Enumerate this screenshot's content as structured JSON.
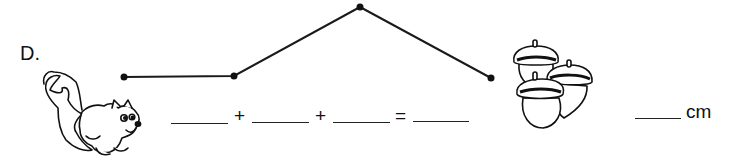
{
  "problem": {
    "label": "D.",
    "path": {
      "points": [
        [
          124,
          77
        ],
        [
          234,
          76
        ],
        [
          360,
          7
        ],
        [
          491,
          78
        ]
      ],
      "segments": 3
    },
    "equation": {
      "blanks": [
        "",
        "",
        "",
        ""
      ],
      "operators": [
        "+",
        "+",
        "="
      ]
    },
    "answer": {
      "blank": "",
      "unit": "cm"
    },
    "images": {
      "left": "squirrel-icon",
      "right": "acorns-icon"
    }
  }
}
